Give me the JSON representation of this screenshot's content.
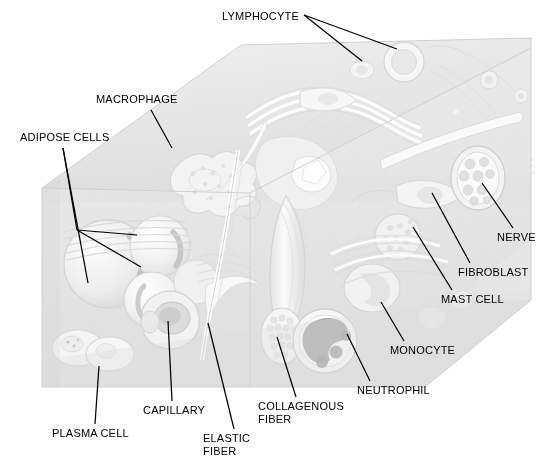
{
  "figure": {
    "type": "anatomical-illustration",
    "canvas": {
      "width": 553,
      "height": 469
    },
    "background_color": "#ffffff",
    "line_color": "#000000",
    "text_color": "#000000",
    "artifact_text": "x c s"
  },
  "labels": [
    {
      "id": "lymphocyte",
      "text": "LYMPHOCYTE",
      "x": 222,
      "y": 10,
      "align": "left",
      "leaders": [
        {
          "x1": 304,
          "y1": 15,
          "x2": 362,
          "y2": 61
        },
        {
          "x1": 304,
          "y1": 15,
          "x2": 397,
          "y2": 49
        }
      ]
    },
    {
      "id": "macrophage",
      "text": "MACROPHAGE",
      "x": 96,
      "y": 93,
      "align": "left",
      "leaders": [
        {
          "x1": 151,
          "y1": 110,
          "x2": 172,
          "y2": 148
        }
      ]
    },
    {
      "id": "adipose-cells",
      "text": "ADIPOSE CELLS",
      "x": 20,
      "y": 131,
      "align": "left",
      "leaders": [
        {
          "x1": 63,
          "y1": 148,
          "x2": 77,
          "y2": 230
        },
        {
          "x1": 77,
          "y1": 230,
          "x2": 137,
          "y2": 235
        },
        {
          "x1": 77,
          "y1": 230,
          "x2": 141,
          "y2": 267
        },
        {
          "x1": 63,
          "y1": 148,
          "x2": 88,
          "y2": 283
        }
      ]
    },
    {
      "id": "nerve",
      "text": "NERVE",
      "x": 497,
      "y": 231,
      "align": "left",
      "leaders": [
        {
          "x1": 513,
          "y1": 228,
          "x2": 482,
          "y2": 183
        }
      ]
    },
    {
      "id": "fibroblast",
      "text": "FIBROBLAST",
      "x": 458,
      "y": 266,
      "align": "left",
      "leaders": [
        {
          "x1": 470,
          "y1": 263,
          "x2": 432,
          "y2": 193
        }
      ]
    },
    {
      "id": "mast-cell",
      "text": "MAST CELL",
      "x": 441,
      "y": 293,
      "align": "left",
      "leaders": [
        {
          "x1": 452,
          "y1": 290,
          "x2": 413,
          "y2": 227
        }
      ]
    },
    {
      "id": "monocyte",
      "text": "MONOCYTE",
      "x": 390,
      "y": 344,
      "align": "left",
      "leaders": [
        {
          "x1": 404,
          "y1": 341,
          "x2": 381,
          "y2": 302
        }
      ]
    },
    {
      "id": "neutrophil",
      "text": "NEUTROPHIL",
      "x": 357,
      "y": 384,
      "align": "left",
      "leaders": [
        {
          "x1": 370,
          "y1": 381,
          "x2": 347,
          "y2": 334
        }
      ]
    },
    {
      "id": "collagenous-fiber",
      "text": "COLLAGENOUS\nFIBER",
      "x": 258,
      "y": 400,
      "align": "left",
      "leaders": [
        {
          "x1": 296,
          "y1": 397,
          "x2": 277,
          "y2": 337
        }
      ]
    },
    {
      "id": "elastic-fiber",
      "text": "ELASTIC\nFIBER",
      "x": 203,
      "y": 432,
      "align": "left",
      "leaders": [
        {
          "x1": 234,
          "y1": 429,
          "x2": 208,
          "y2": 323
        }
      ]
    },
    {
      "id": "capillary",
      "text": "CAPILLARY",
      "x": 143,
      "y": 404,
      "align": "left",
      "leaders": [
        {
          "x1": 172,
          "y1": 401,
          "x2": 168,
          "y2": 321
        }
      ]
    },
    {
      "id": "plasma-cell",
      "text": "PLASMA CELL",
      "x": 52,
      "y": 427,
      "align": "left",
      "leaders": [
        {
          "x1": 95,
          "y1": 424,
          "x2": 99,
          "y2": 366
        }
      ]
    }
  ],
  "illustration": {
    "description": "Three-dimensional block of loose (areolar) connective tissue rendered as a pale monochrome wash drawing, showing a top face and a front cut face.",
    "block_faces": [
      {
        "name": "top-face",
        "fill": "#e8e8e8"
      },
      {
        "name": "front-face",
        "fill": "#ececec"
      },
      {
        "name": "side-face",
        "fill": "#e2e2e2"
      }
    ],
    "structures": [
      "adipose cells",
      "macrophage",
      "lymphocyte",
      "plasma cell",
      "capillary",
      "elastic fiber",
      "collagenous fiber",
      "neutrophil",
      "monocyte",
      "mast cell",
      "fibroblast",
      "nerve"
    ]
  }
}
